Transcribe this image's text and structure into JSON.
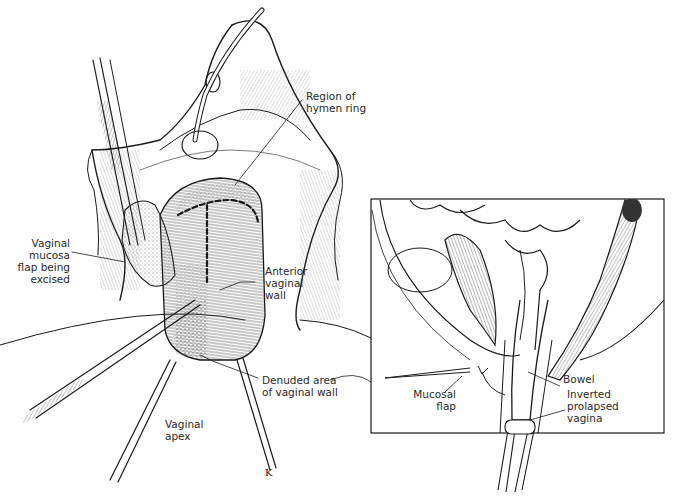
{
  "figure": {
    "type": "surgical illustration",
    "main_view": {
      "labels": [
        {
          "id": "hymen",
          "text": "Region of\nhymen ring"
        },
        {
          "id": "mucosa-flap",
          "text": "Vaginal\nmucosa\nflap being\nexcised"
        },
        {
          "id": "anterior-wall",
          "text": "Anterior\nvaginal\nwall"
        },
        {
          "id": "denuded",
          "text": "Denuded area\nof  vaginal wall"
        },
        {
          "id": "apex",
          "text": "Vaginal\napex"
        }
      ],
      "artist_mark": "K"
    },
    "inset_view": {
      "labels": [
        {
          "id": "bowel",
          "text": "Bowel"
        },
        {
          "id": "mucosal-flap",
          "text": "Mucosal\nflap"
        },
        {
          "id": "inverted",
          "text": "Inverted\nprolapsed\nvagina"
        }
      ]
    },
    "colors": {
      "ink": "#1a1a1a",
      "paper": "#ffffff",
      "stipple": "#555555"
    }
  }
}
